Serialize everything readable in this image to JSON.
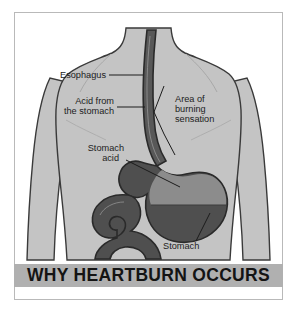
{
  "figure": {
    "title": "WHY HEARTBURN OCCURS",
    "labels": {
      "esophagus": "Esophagus",
      "acid_from_line1": "Acid from",
      "acid_from_line2": "the stomach",
      "burning_line1": "Area of",
      "burning_line2": "burning",
      "burning_line3": "sensation",
      "stomach_acid_line1": "Stomach",
      "stomach_acid_line2": "acid",
      "stomach": "Stomach"
    },
    "colors": {
      "page_background": "#ffffff",
      "frame_border": "#b9b9b9",
      "body_fill": "#c4c4c4",
      "body_outline": "#3a3a3a",
      "stomach_fill": "#4f4f4f",
      "stomach_acid_fill": "#8c8c8c",
      "esophagus_fill": "#4a4a4a",
      "intestine_fill": "#4f4f4f",
      "banner_fill": "#b0b0b0",
      "label_text": "#1c1c1c",
      "banner_text": "#141414",
      "arm_gap": "#ffffff"
    }
  }
}
